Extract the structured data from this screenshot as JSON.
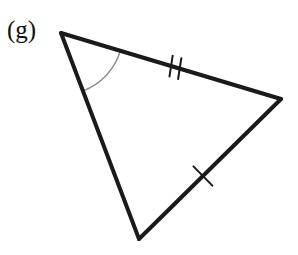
{
  "figure": {
    "label": "(g)",
    "kind": "triangle-diagram",
    "background_color": "#ffffff",
    "stroke_color": "#1a1a1a",
    "arc_color": "#8c8c8c",
    "tick_color": "#1a1a1a",
    "stroke_width": 4,
    "tick_width": 2,
    "arc_width": 1.4,
    "width": 298,
    "height": 255
  },
  "geometry": {
    "vertices": [
      {
        "name": "apex-top-left",
        "x": 61,
        "y": 33
      },
      {
        "name": "vertex-right",
        "x": 281,
        "y": 99
      },
      {
        "name": "vertex-bottom",
        "x": 139,
        "y": 239
      }
    ],
    "sides": [
      {
        "name": "side-top",
        "from": "apex-top-left",
        "to": "vertex-right",
        "marks": 2
      },
      {
        "name": "side-right",
        "from": "vertex-right",
        "to": "vertex-bottom",
        "marks": 1
      },
      {
        "name": "side-left",
        "from": "vertex-bottom",
        "to": "apex-top-left",
        "marks": 0
      }
    ],
    "angle_marks": [
      {
        "name": "angle-arc-apex",
        "at": "apex-top-left",
        "radius": 62,
        "style": "single-arc"
      }
    ],
    "tick_marks": [
      {
        "name": "tick-double-top-side",
        "on": "side-top",
        "count": 2,
        "position_fraction": 0.52,
        "length": 21,
        "spacing": 9,
        "tilt_deg": -8
      },
      {
        "name": "tick-single-right-side",
        "on": "side-right",
        "count": 1,
        "position_fraction": 0.55,
        "length": 27,
        "spacing": 0,
        "tilt_deg": 0
      }
    ]
  }
}
